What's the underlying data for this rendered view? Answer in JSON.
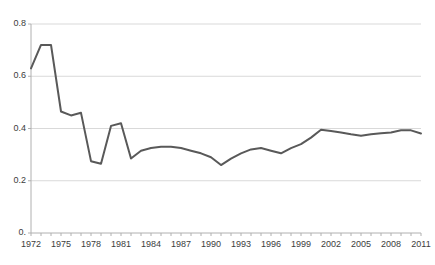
{
  "chart_data": {
    "type": "line",
    "title": "",
    "xlabel": "",
    "ylabel": "",
    "x": [
      1972,
      1973,
      1974,
      1975,
      1976,
      1977,
      1978,
      1979,
      1980,
      1981,
      1982,
      1983,
      1984,
      1985,
      1986,
      1987,
      1988,
      1989,
      1990,
      1991,
      1992,
      1993,
      1994,
      1995,
      1996,
      1997,
      1998,
      1999,
      2000,
      2001,
      2002,
      2003,
      2004,
      2005,
      2006,
      2007,
      2008,
      2009,
      2010,
      2011
    ],
    "values": [
      0.63,
      0.72,
      0.72,
      0.465,
      0.45,
      0.46,
      0.275,
      0.265,
      0.41,
      0.42,
      0.285,
      0.315,
      0.325,
      0.33,
      0.33,
      0.325,
      0.315,
      0.305,
      0.29,
      0.26,
      0.285,
      0.305,
      0.32,
      0.325,
      0.315,
      0.305,
      0.325,
      0.34,
      0.365,
      0.395,
      0.39,
      0.385,
      0.378,
      0.372,
      0.378,
      0.382,
      0.385,
      0.393,
      0.393,
      0.381
    ],
    "series": [
      {
        "name": "series-1",
        "values": [
          0.63,
          0.72,
          0.72,
          0.465,
          0.45,
          0.46,
          0.275,
          0.265,
          0.41,
          0.42,
          0.285,
          0.315,
          0.325,
          0.33,
          0.33,
          0.325,
          0.315,
          0.305,
          0.29,
          0.26,
          0.285,
          0.305,
          0.32,
          0.325,
          0.315,
          0.305,
          0.325,
          0.34,
          0.365,
          0.395,
          0.39,
          0.385,
          0.378,
          0.372,
          0.378,
          0.382,
          0.385,
          0.393,
          0.393,
          0.381
        ],
        "color": "#595959"
      }
    ],
    "ylim": [
      0,
      0.8
    ],
    "xlim": [
      1972,
      2011
    ],
    "yticks": [
      0,
      0.2,
      0.4,
      0.6,
      0.8
    ],
    "ytick_labels": [
      "0.",
      "0.2",
      "0.4",
      "0.6",
      "0.8"
    ],
    "xticks": [
      1972,
      1975,
      1978,
      1981,
      1984,
      1987,
      1990,
      1993,
      1996,
      1999,
      2002,
      2005,
      2008,
      2011
    ],
    "xtick_labels": [
      "1972",
      "1975",
      "1978",
      "1981",
      "1984",
      "1987",
      "1990",
      "1993",
      "1996",
      "1999",
      "2002",
      "2005",
      "2008",
      "2011"
    ],
    "xtick_minor_step": 1,
    "grid": "horizontal",
    "grid_color": "#d9d9d9",
    "axis_color": "#b0b0b0",
    "legend": "none",
    "line_color": "#595959",
    "line_width": 2
  },
  "title_remnant": "",
  "plot_geometry": {
    "left": 31,
    "right": 421,
    "top": 24,
    "bottom": 233
  }
}
